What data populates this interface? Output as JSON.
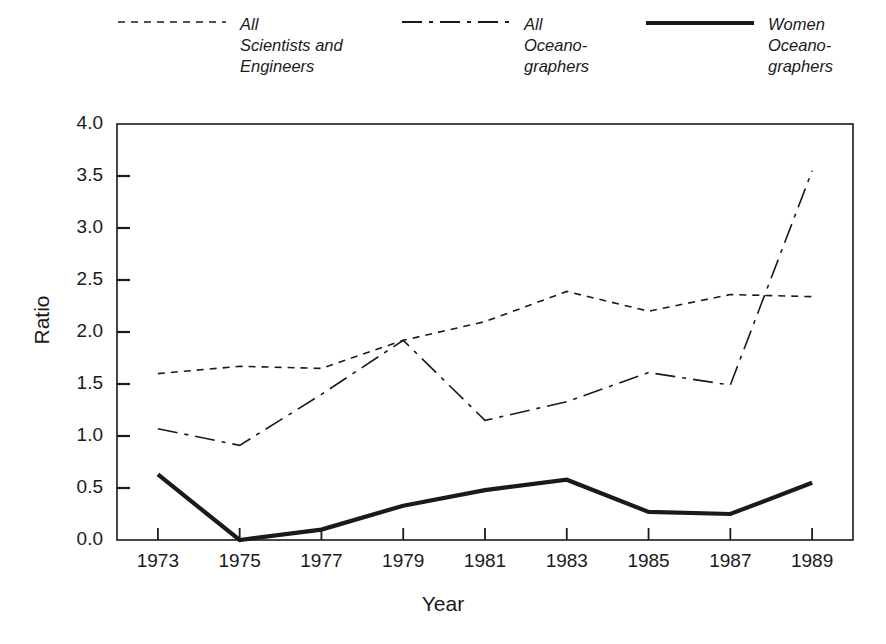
{
  "chart_data": {
    "type": "line",
    "title": "",
    "xlabel": "Year",
    "ylabel": "Ratio",
    "x": [
      1973,
      1975,
      1977,
      1979,
      1981,
      1983,
      1985,
      1987,
      1989
    ],
    "xtick_labels": [
      "1973",
      "1975",
      "1977",
      "1979",
      "1981",
      "1983",
      "1985",
      "1987",
      "1989"
    ],
    "ytick_labels": [
      "0.0",
      "0.5",
      "1.0",
      "1.5",
      "2.0",
      "2.5",
      "3.0",
      "3.5",
      "4.0"
    ],
    "ytick_values": [
      0.0,
      0.5,
      1.0,
      1.5,
      2.0,
      2.5,
      3.0,
      3.5,
      4.0
    ],
    "xlim": [
      1972,
      1990
    ],
    "ylim": [
      0.0,
      4.0
    ],
    "grid": false,
    "legend_position": "above-plot",
    "series": [
      {
        "name": "All Scientists and Engineers",
        "legend_label": "All\nScientists and\nEngineers",
        "style": "dashed",
        "color": "#1a1a1a",
        "width": 1.6,
        "values": [
          1.6,
          1.67,
          1.65,
          1.92,
          2.1,
          2.39,
          2.2,
          2.36,
          2.34
        ]
      },
      {
        "name": "All Oceanographers",
        "legend_label": "All\nOceano-\ngraphers",
        "style": "dash-dot",
        "color": "#1a1a1a",
        "width": 1.6,
        "values": [
          1.07,
          0.91,
          1.4,
          1.92,
          1.15,
          1.33,
          1.61,
          1.49,
          3.55
        ]
      },
      {
        "name": "Women Oceanographers",
        "legend_label": "Women\nOceano-\ngraphers",
        "style": "solid",
        "color": "#1a1a1a",
        "width": 4.2,
        "values": [
          0.63,
          0.0,
          0.1,
          0.33,
          0.48,
          0.58,
          0.27,
          0.25,
          0.55
        ]
      }
    ]
  }
}
